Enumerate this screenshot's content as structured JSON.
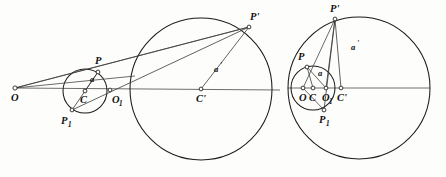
{
  "figure": {
    "background_color": "#fdfdfc",
    "stroke_color": "#1b1b1b",
    "ray_color": "#3a3a3a",
    "label_color": "#111111",
    "panels": [
      {
        "id": "left-panel",
        "name": "external-centers-configuration",
        "description": "Small circle centered at C and large circle centered at C-prime lying outside one another, joined by rays from external point O",
        "points": [
          {
            "key": "O",
            "label": "O",
            "sub": "",
            "x": 15,
            "y": 88,
            "label_x": 11,
            "label_y": 101,
            "dot": true
          },
          {
            "key": "C",
            "label": "C",
            "sub": "",
            "x": 85,
            "y": 91,
            "label_x": 80,
            "label_y": 103,
            "dot": true
          },
          {
            "key": "O1",
            "label": "O",
            "sub": "1",
            "x": 110,
            "y": 90,
            "label_x": 112,
            "label_y": 103,
            "dot": true
          },
          {
            "key": "P",
            "label": "P",
            "sub": "",
            "x": 98,
            "y": 72,
            "label_x": 95,
            "label_y": 64,
            "dot": true
          },
          {
            "key": "P1",
            "label": "P",
            "sub": "1",
            "x": 72,
            "y": 110,
            "label_x": 61,
            "label_y": 124,
            "dot": true
          },
          {
            "key": "Cp",
            "label": "C'",
            "sub": "",
            "x": 201,
            "y": 89,
            "label_x": 196,
            "label_y": 102,
            "dot": true
          },
          {
            "key": "Pp",
            "label": "P'",
            "sub": "",
            "x": 249,
            "y": 27,
            "label_x": 250,
            "label_y": 20,
            "dot": true
          }
        ],
        "circles": [
          {
            "name": "small-circle-C",
            "cx": 85,
            "cy": 91,
            "r": 22
          },
          {
            "name": "large-circle-Cp",
            "cx": 201,
            "cy": 89,
            "r": 71
          }
        ],
        "segments": [
          {
            "name": "axis-O-to-Cp",
            "x1": 15,
            "y1": 88,
            "x2": 280,
            "y2": 90
          },
          {
            "name": "ray-O-through-P-to-Pp",
            "x1": 15,
            "y1": 88,
            "x2": 249,
            "y2": 27
          },
          {
            "name": "ray-O-through-P1-to-Pp",
            "x1": 15,
            "y1": 88,
            "x2": 249,
            "y2": 27
          },
          {
            "name": "chord-P1-to-Pp",
            "x1": 72,
            "y1": 110,
            "x2": 249,
            "y2": 27
          },
          {
            "name": "chord-P-to-P1",
            "x1": 98,
            "y1": 72,
            "x2": 72,
            "y2": 110
          },
          {
            "name": "radius-a-C-to-P",
            "x1": 85,
            "y1": 91,
            "x2": 98,
            "y2": 72
          },
          {
            "name": "radius-ap-Cp-to-Pp",
            "x1": 201,
            "y1": 89,
            "x2": 249,
            "y2": 27
          }
        ],
        "measure_labels": [
          {
            "name": "alpha-label-small",
            "text": "a",
            "prime": "",
            "x": 90,
            "y": 82
          },
          {
            "name": "alpha-prime-label-large",
            "text": "a",
            "prime": "'",
            "x": 214,
            "y": 72
          }
        ]
      },
      {
        "id": "right-panel",
        "name": "internal-nested-configuration",
        "description": "Small circle centered at C nested inside large circle centered at C-prime, sharing the apex point P-prime",
        "points": [
          {
            "key": "O",
            "label": "O",
            "sub": "",
            "x": 303,
            "y": 88,
            "label_x": 299,
            "label_y": 101,
            "dot": true
          },
          {
            "key": "C",
            "label": "C",
            "sub": "",
            "x": 313,
            "y": 88,
            "label_x": 309,
            "label_y": 101,
            "dot": true
          },
          {
            "key": "O1",
            "label": "O",
            "sub": "1",
            "x": 326,
            "y": 88,
            "label_x": 324,
            "label_y": 101,
            "dot": true
          },
          {
            "key": "Cp",
            "label": "C'",
            "sub": "",
            "x": 341,
            "y": 88,
            "label_x": 337,
            "label_y": 101,
            "dot": true
          },
          {
            "key": "P",
            "label": "P",
            "sub": "",
            "x": 307,
            "y": 67,
            "label_x": 298,
            "label_y": 60,
            "dot": true
          },
          {
            "key": "P1",
            "label": "P",
            "sub": "1",
            "x": 324,
            "y": 110,
            "label_x": 319,
            "label_y": 123,
            "dot": true
          },
          {
            "key": "Pp",
            "label": "P'",
            "sub": "",
            "x": 335,
            "y": 19,
            "label_x": 330,
            "label_y": 12,
            "dot": true
          }
        ],
        "circles": [
          {
            "name": "small-circle-C",
            "cx": 313,
            "cy": 88,
            "r": 22
          },
          {
            "name": "large-circle-Cp",
            "cx": 359,
            "cy": 88,
            "r": 71
          }
        ],
        "segments": [
          {
            "name": "axis-horizontal",
            "x1": 288,
            "y1": 88,
            "x2": 430,
            "y2": 88
          },
          {
            "name": "ray-O-through-P-to-Pp",
            "x1": 303,
            "y1": 88,
            "x2": 335,
            "y2": 19
          },
          {
            "name": "ray-O-through-P1",
            "x1": 303,
            "y1": 88,
            "x2": 324,
            "y2": 110
          },
          {
            "name": "chord-P1-to-Pp",
            "x1": 324,
            "y1": 110,
            "x2": 335,
            "y2": 19
          },
          {
            "name": "chord-P-to-O1",
            "x1": 307,
            "y1": 67,
            "x2": 326,
            "y2": 88
          },
          {
            "name": "radius-a-C-to-P",
            "x1": 313,
            "y1": 88,
            "x2": 307,
            "y2": 67
          },
          {
            "name": "vertical-O1-to-Pp",
            "x1": 326,
            "y1": 88,
            "x2": 335,
            "y2": 19
          },
          {
            "name": "radius-ap-Cp-to-Pp",
            "x1": 341,
            "y1": 88,
            "x2": 335,
            "y2": 19
          }
        ],
        "measure_labels": [
          {
            "name": "alpha-label-small",
            "text": "a",
            "prime": "",
            "x": 318,
            "y": 76
          },
          {
            "name": "alpha-prime-label-large",
            "text": "a",
            "prime": "'",
            "x": 351,
            "y": 50
          }
        ]
      }
    ]
  }
}
